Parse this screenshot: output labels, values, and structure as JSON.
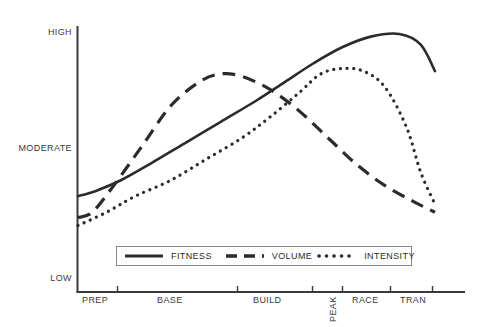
{
  "chart_data": {
    "type": "line",
    "title": "",
    "subtitle": "",
    "xlabel": "",
    "ylabel": "",
    "grid": false,
    "legend_position": "bottom-center",
    "x_tick_labels": [
      "PREP",
      "BASE",
      "BUILD",
      "PEAK",
      "RACE",
      "TRAN"
    ],
    "y_tick_labels": [
      "HIGH",
      "MODERATE",
      "LOW"
    ],
    "ylim": [
      0,
      100
    ],
    "y_tick_values": [
      100,
      50,
      0
    ],
    "x_categories": [
      "PREP",
      "BASE",
      "BUILD",
      "PEAK",
      "RACE",
      "TRAN"
    ],
    "series": [
      {
        "name": "FITNESS",
        "style": "solid",
        "color": "#2b2b2b",
        "x": [
          0,
          5,
          12,
          20,
          30,
          40,
          50,
          58,
          66,
          74,
          82,
          90,
          96,
          100
        ],
        "values": [
          36,
          38,
          42,
          48,
          56,
          64,
          72,
          79,
          86,
          92,
          96,
          97,
          93,
          83
        ]
      },
      {
        "name": "VOLUME",
        "style": "dashed",
        "color": "#2b2b2b",
        "x": [
          0,
          4,
          10,
          18,
          26,
          34,
          40,
          46,
          54,
          62,
          70,
          78,
          86,
          94,
          100
        ],
        "values": [
          28,
          30,
          40,
          55,
          70,
          79,
          82,
          81,
          76,
          68,
          58,
          48,
          40,
          34,
          30
        ]
      },
      {
        "name": "INTENSITY",
        "style": "dotted",
        "color": "#2b2b2b",
        "x": [
          0,
          8,
          16,
          26,
          36,
          46,
          54,
          62,
          68,
          74,
          80,
          86,
          92,
          96,
          100
        ],
        "values": [
          25,
          30,
          36,
          42,
          50,
          58,
          66,
          75,
          82,
          84,
          83,
          77,
          62,
          45,
          33
        ]
      }
    ]
  },
  "axis": {
    "y_labels": [
      {
        "text": "HIGH",
        "top": 27
      },
      {
        "text": "MODERATE",
        "top": 143
      },
      {
        "text": "LOW",
        "top": 273
      }
    ],
    "x_labels": [
      {
        "text": "PREP",
        "left": 82,
        "rotated": false
      },
      {
        "text": "BASE",
        "left": 157,
        "rotated": false
      },
      {
        "text": "BUILD",
        "left": 253,
        "rotated": false
      },
      {
        "text": "PEAK",
        "left": 318,
        "rotated": true
      },
      {
        "text": "RACE",
        "left": 352,
        "rotated": false
      },
      {
        "text": "TRAN",
        "left": 400,
        "rotated": false
      }
    ]
  },
  "legend": {
    "entries": [
      {
        "label": "FITNESS",
        "style": "solid"
      },
      {
        "label": "VOLUME",
        "style": "dashed"
      },
      {
        "label": "INTENSITY",
        "style": "dotted"
      }
    ]
  },
  "colors": {
    "line": "#2b2b2b",
    "axis": "#3a3a3a",
    "legend_border": "#8a8a8a",
    "text": "#3a3a3a",
    "background": "#ffffff"
  }
}
